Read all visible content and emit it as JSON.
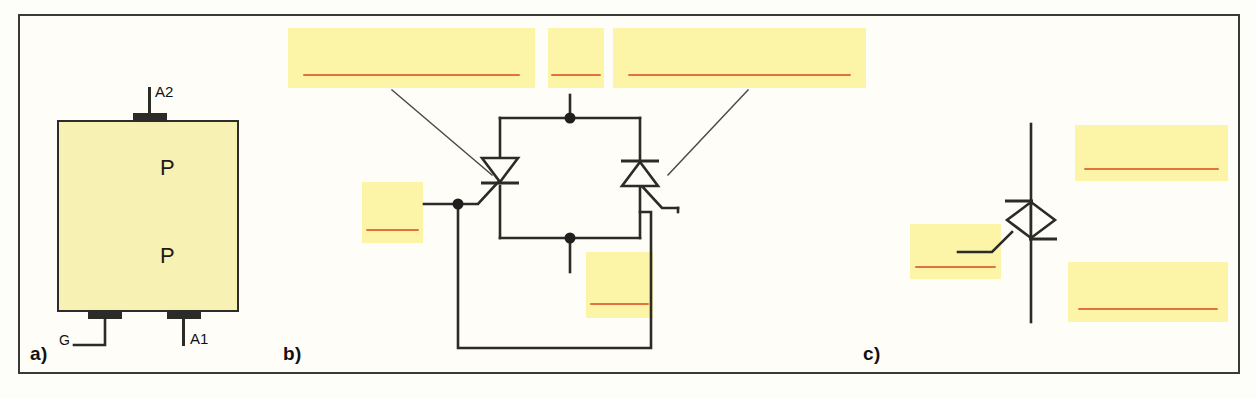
{
  "figure": {
    "background_color": "#fdfdfa",
    "frame_color": "#3a3a38",
    "highlight_color": "#fcf5a8",
    "rule_color": "#e2733c",
    "line_color": "#2b2b28",
    "die_fill_color": "#f7f2b4"
  },
  "panels": [
    {
      "id": "a",
      "label": "a)"
    },
    {
      "id": "b",
      "label": "b)"
    },
    {
      "id": "c",
      "label": "c)"
    }
  ],
  "panel_a": {
    "terminals": [
      {
        "name": "A2",
        "label": "A2"
      },
      {
        "name": "A1",
        "label": "A1"
      },
      {
        "name": "G",
        "label": "G"
      }
    ],
    "layers": [
      {
        "label": "P"
      },
      {
        "label": "P"
      }
    ]
  },
  "panel_b": {
    "description_boxes": [
      {
        "name": "top-left-annotation",
        "text": ""
      },
      {
        "name": "top-middle-annotation",
        "text": ""
      },
      {
        "name": "top-right-annotation",
        "text": ""
      },
      {
        "name": "left-annotation",
        "text": ""
      },
      {
        "name": "bottom-annotation",
        "text": ""
      }
    ]
  },
  "panel_c": {
    "description_boxes": [
      {
        "name": "top-right-annotation",
        "text": ""
      },
      {
        "name": "left-annotation",
        "text": ""
      },
      {
        "name": "bottom-right-annotation",
        "text": ""
      }
    ]
  }
}
